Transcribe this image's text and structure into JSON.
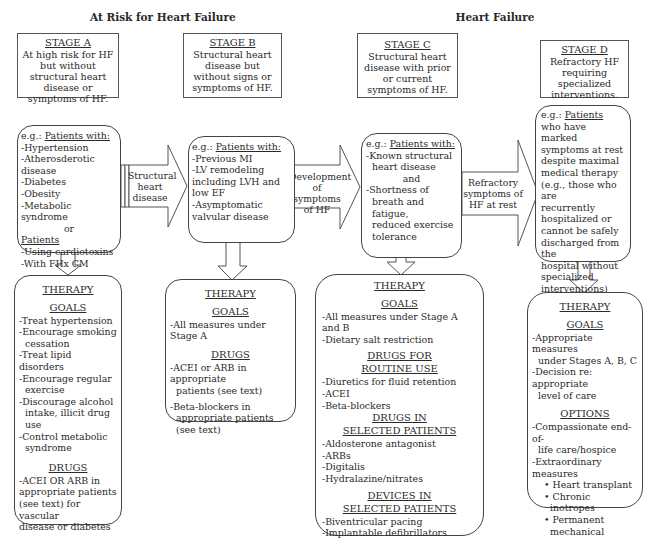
{
  "headers": {
    "left": "At Risk for Heart Failure",
    "right": "Heart Failure"
  },
  "stages": [
    {
      "id": "A",
      "title": "STAGE A",
      "description": "At high risk for HF but without structural heart disease or symptoms of HF."
    },
    {
      "id": "B",
      "title": "STAGE B",
      "description": "Structural heart disease but without signs or symptoms of HF."
    },
    {
      "id": "C",
      "title": "STAGE C",
      "description": "Structural heart disease with prior or current symptoms of HF."
    },
    {
      "id": "D",
      "title": "STAGE D",
      "description": "Refractory HF requiring specialized interventions."
    }
  ],
  "patients": {
    "A": {
      "prefix": "e.g.: ",
      "heading": "Patients with:",
      "items": [
        "-Hypertension",
        "-Atherosderotic disease",
        "-Diabetes",
        "-Obesity",
        "-Metabolic syndrome"
      ],
      "or": "or",
      "heading2": "Patients",
      "items2": [
        "-Using cardiotoxins",
        "-With FHx CM"
      ]
    },
    "B": {
      "prefix": "e.g.: ",
      "heading": "Patients with:",
      "items": [
        "-Previous MI",
        "-LV remodeling",
        "including LVH and",
        "low EF",
        "-Asymptomatic",
        "valvular disease"
      ]
    },
    "C": {
      "prefix": "e.g.: ",
      "heading": "Patients with:",
      "items": [
        "-Known structural",
        "heart disease"
      ],
      "and": "and",
      "items2": [
        "-Shortness of",
        "breath and fatigue,",
        "reduced exercise",
        "tolerance"
      ]
    },
    "D": {
      "prefix": "e.g.: ",
      "heading": "Patients",
      "items": [
        "who have marked",
        "symptoms at rest",
        "despite maximal",
        "medical therapy",
        "(e.g., those who are",
        "recurrently",
        "hospitalized or",
        "cannot be safely",
        "discharged from the",
        "hospital without",
        "specialized",
        "interventions)"
      ]
    }
  },
  "transitions": [
    {
      "from": "A",
      "to": "B",
      "lines": [
        "Structural",
        "heart",
        "disease"
      ]
    },
    {
      "from": "B",
      "to": "C",
      "lines": [
        "Development",
        "of symptoms",
        "of HF"
      ]
    },
    {
      "from": "C",
      "to": "D",
      "lines": [
        "Refractory",
        "symptoms of",
        "HF at rest"
      ]
    }
  ],
  "therapy": {
    "A": {
      "title": "THERAPY",
      "sections": [
        {
          "heading": "GOALS",
          "items": [
            "-Treat hypertension",
            "-Encourage smoking",
            "cessation",
            "-Treat lipid disorders",
            "-Encourage regular",
            "exercise",
            "-Discourage alcohol",
            "intake, illicit drug use",
            "-Control metabolic",
            "syndrome"
          ]
        },
        {
          "heading": "DRUGS",
          "items": [
            "-ACEI OR ARB in",
            "appropriate patients",
            "(see text) for vascular",
            "disease or diabetes"
          ]
        }
      ]
    },
    "B": {
      "title": "THERAPY",
      "sections": [
        {
          "heading": "GOALS",
          "items": [
            "-All measures under Stage A"
          ]
        },
        {
          "heading": "DRUGS",
          "items": [
            "-ACEI or ARB in appropriate",
            "patients (see text)",
            "-Beta-blockers in",
            "appropriate patients",
            "(see text)"
          ]
        }
      ]
    },
    "C": {
      "title": "THERAPY",
      "sections": [
        {
          "heading": "GOALS",
          "items": [
            "-All measures under Stage A and B",
            "-Dietary salt restriction"
          ]
        },
        {
          "heading": "DRUGS FOR ROUTINE USE",
          "heading_lines": [
            "DRUGS FOR",
            "ROUTINE USE"
          ],
          "items": [
            "-Diuretics for fluid retention",
            "-ACEI",
            "-Beta-blockers"
          ]
        },
        {
          "heading": "DRUGS IN SELECTED PATIENTS",
          "heading_lines": [
            "DRUGS IN",
            "SELECTED PATIENTS"
          ],
          "items": [
            "-Aldosterone antagonist",
            "-ARBs",
            "-Digitalis",
            "-Hydralazine/nitrates"
          ]
        },
        {
          "heading": "DEVICES IN SELECTED PATIENTS",
          "heading_lines": [
            "DEVICES IN",
            "SELECTED PATIENTS"
          ],
          "items": [
            "-Biventricular pacing",
            "-Implantable defibrillators"
          ]
        }
      ]
    },
    "D": {
      "title": "THERAPY",
      "sections": [
        {
          "heading": "GOALS",
          "items": [
            "-Appropriate measures",
            "under Stages A, B, C",
            "-Decision re: appropriate",
            "level of care"
          ]
        },
        {
          "heading": "OPTIONS",
          "items": [
            "-Compassionate end-of-",
            "life care/hospice",
            "-Extraordinary measures"
          ],
          "bullets": [
            "• Heart transplant",
            "• Chronic inotropes",
            "• Permanent",
            "mechanical support",
            "• Experimental",
            "surgery or drugs"
          ]
        }
      ]
    }
  },
  "colors": {
    "stroke": "#444444",
    "text": "#2a2a2a",
    "background": "#ffffff"
  }
}
